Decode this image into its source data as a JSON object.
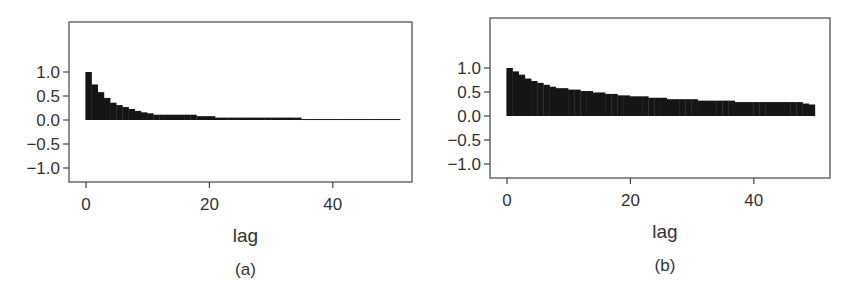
{
  "chart_data": [
    {
      "panel": "(a)",
      "type": "bar",
      "title": "",
      "xlabel": "lag",
      "ylabel": "",
      "caption": "(a)",
      "xlim": [
        -1,
        51
      ],
      "ylim": [
        -1.3,
        1.9
      ],
      "xticks": [
        0,
        20,
        40
      ],
      "yticks": [
        1.0,
        0.5,
        0.0,
        -0.5,
        -1.0
      ],
      "ytick_labels": [
        "1.0",
        "0.5",
        "0.0",
        "−0.5",
        "−1.0"
      ],
      "xtick_labels": [
        "0",
        "20",
        "40"
      ],
      "grid": false,
      "legend": null,
      "x": [
        0,
        1,
        2,
        3,
        4,
        5,
        6,
        7,
        8,
        9,
        10,
        11,
        12,
        13,
        14,
        15,
        16,
        17,
        18,
        19,
        20,
        21,
        22,
        23,
        24,
        25,
        26,
        27,
        28,
        29,
        30,
        31,
        32,
        33,
        34,
        35,
        36,
        37,
        38,
        39,
        40,
        41,
        42,
        43,
        44,
        45,
        46,
        47,
        48,
        49,
        50
      ],
      "values": [
        1.0,
        0.74,
        0.58,
        0.46,
        0.36,
        0.31,
        0.27,
        0.23,
        0.19,
        0.16,
        0.14,
        0.11,
        0.11,
        0.11,
        0.11,
        0.11,
        0.11,
        0.11,
        0.08,
        0.08,
        0.08,
        0.05,
        0.05,
        0.05,
        0.05,
        0.05,
        0.05,
        0.05,
        0.05,
        0.05,
        0.05,
        0.05,
        0.05,
        0.05,
        0.05,
        0.02,
        0.02,
        0.02,
        0.02,
        0.02,
        0.02,
        0.02,
        0.02,
        0.02,
        0.02,
        0.02,
        0.02,
        0.02,
        0.02,
        0.02,
        0.02
      ]
    },
    {
      "panel": "(b)",
      "type": "bar",
      "title": "",
      "xlabel": "lag",
      "ylabel": "",
      "caption": "(b)",
      "xlim": [
        -1,
        51
      ],
      "ylim": [
        -1.3,
        1.9
      ],
      "xticks": [
        0,
        20,
        40
      ],
      "yticks": [
        1.0,
        0.5,
        0.0,
        -0.5,
        -1.0
      ],
      "ytick_labels": [
        "1.0",
        "0.5",
        "0.0",
        "−0.5",
        "−1.0"
      ],
      "xtick_labels": [
        "0",
        "20",
        "40"
      ],
      "grid": false,
      "legend": null,
      "x": [
        0,
        1,
        2,
        3,
        4,
        5,
        6,
        7,
        8,
        9,
        10,
        11,
        12,
        13,
        14,
        15,
        16,
        17,
        18,
        19,
        20,
        21,
        22,
        23,
        24,
        25,
        26,
        27,
        28,
        29,
        30,
        31,
        32,
        33,
        34,
        35,
        36,
        37,
        38,
        39,
        40,
        41,
        42,
        43,
        44,
        45,
        46,
        47,
        48,
        49
      ],
      "values": [
        1.0,
        0.93,
        0.86,
        0.78,
        0.73,
        0.69,
        0.65,
        0.61,
        0.58,
        0.58,
        0.55,
        0.55,
        0.52,
        0.52,
        0.49,
        0.49,
        0.46,
        0.46,
        0.43,
        0.43,
        0.41,
        0.41,
        0.41,
        0.38,
        0.38,
        0.38,
        0.35,
        0.35,
        0.35,
        0.35,
        0.35,
        0.32,
        0.32,
        0.32,
        0.32,
        0.32,
        0.32,
        0.29,
        0.29,
        0.29,
        0.29,
        0.29,
        0.29,
        0.29,
        0.29,
        0.29,
        0.29,
        0.29,
        0.26,
        0.24
      ]
    }
  ],
  "layout": [
    {
      "frame": {
        "left": 69,
        "top": 22,
        "right": 412,
        "bottom": 182
      },
      "x0": 86,
      "px_per_lag": 6.17,
      "y0": 120,
      "px_per_unit": 48
    },
    {
      "frame": {
        "left": 490,
        "top": 18,
        "right": 830,
        "bottom": 178
      },
      "x0": 507,
      "px_per_lag": 6.17,
      "y0": 116,
      "px_per_unit": 48
    }
  ],
  "colors": {
    "bar": "#151515",
    "axis": "#444444",
    "text": "#333333"
  }
}
